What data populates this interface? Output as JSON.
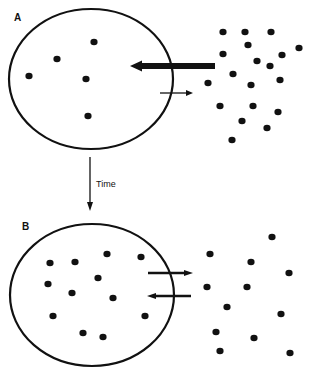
{
  "panels": [
    {
      "id": "A",
      "label": "A",
      "label_pos": [
        14,
        21
      ],
      "cell": {
        "cx": 91,
        "cy": 79,
        "rx": 82,
        "ry": 70
      },
      "inside_particles": [
        [
          94,
          42
        ],
        [
          57,
          59
        ],
        [
          29,
          76
        ],
        [
          86,
          79
        ],
        [
          88,
          116
        ]
      ],
      "outside_particles": [
        [
          223,
          32
        ],
        [
          245,
          32
        ],
        [
          271,
          32
        ],
        [
          248,
          45
        ],
        [
          223,
          54
        ],
        [
          299,
          48
        ],
        [
          282,
          55
        ],
        [
          257,
          61
        ],
        [
          270,
          66
        ],
        [
          233,
          74
        ],
        [
          208,
          83
        ],
        [
          251,
          85
        ],
        [
          280,
          80
        ],
        [
          220,
          106
        ],
        [
          253,
          106
        ],
        [
          278,
          112
        ],
        [
          242,
          121
        ],
        [
          267,
          128
        ],
        [
          232,
          140
        ]
      ],
      "arrows": [
        {
          "name": "influx-arrow",
          "x1": 215,
          "y1": 66,
          "x2": 130,
          "y2": 66,
          "width": 6,
          "head": 12
        },
        {
          "name": "efflux-arrow",
          "x1": 160,
          "y1": 93,
          "x2": 193,
          "y2": 93,
          "width": 1.3,
          "head": 7
        }
      ]
    },
    {
      "id": "B",
      "label": "B",
      "label_pos": [
        22,
        230
      ],
      "cell": {
        "cx": 92,
        "cy": 295,
        "rx": 82,
        "ry": 71
      },
      "inside_particles": [
        [
          50,
          263
        ],
        [
          75,
          262
        ],
        [
          107,
          254
        ],
        [
          141,
          257
        ],
        [
          48,
          284
        ],
        [
          98,
          278
        ],
        [
          72,
          293
        ],
        [
          113,
          298
        ],
        [
          53,
          316
        ],
        [
          145,
          316
        ],
        [
          83,
          333
        ],
        [
          103,
          337
        ]
      ],
      "outside_particles": [
        [
          272,
          237
        ],
        [
          210,
          254
        ],
        [
          251,
          262
        ],
        [
          289,
          273
        ],
        [
          207,
          287
        ],
        [
          247,
          287
        ],
        [
          227,
          307
        ],
        [
          281,
          314
        ],
        [
          216,
          332
        ],
        [
          254,
          338
        ],
        [
          220,
          351
        ],
        [
          290,
          353
        ]
      ],
      "arrows": [
        {
          "name": "efflux-arrow",
          "x1": 148,
          "y1": 273,
          "x2": 193,
          "y2": 273,
          "width": 2.5,
          "head": 9
        },
        {
          "name": "influx-arrow",
          "x1": 191,
          "y1": 296,
          "x2": 147,
          "y2": 296,
          "width": 2.5,
          "head": 9
        }
      ]
    }
  ],
  "time_arrow": {
    "label": "Time",
    "x": 90,
    "y1": 157,
    "y2": 211,
    "label_x": 96,
    "label_y": 187
  },
  "colors": {
    "ink": "#111111",
    "background": "#ffffff"
  }
}
